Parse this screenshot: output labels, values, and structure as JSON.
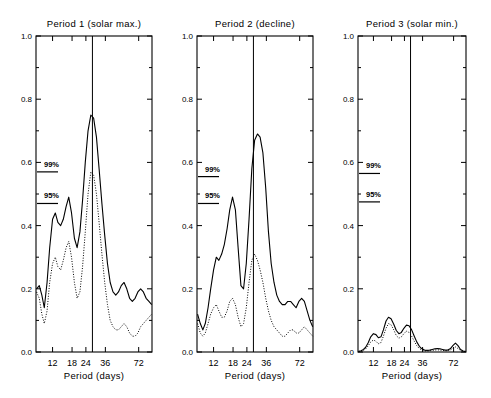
{
  "figure": {
    "xlabel": "Period (days)",
    "x_ticks": [
      "12",
      "18",
      "24",
      "36",
      "72"
    ],
    "y_ticks": [
      "0.0",
      "0.2",
      "0.4",
      "0.6",
      "0.8",
      "1.0"
    ],
    "sig99_label": "99%",
    "sig95_label": "95%"
  },
  "chart_data": [
    {
      "type": "line",
      "title": "Period 1 (solar max.)",
      "xlabel": "Period (days)",
      "ylabel": "",
      "xscale": "log",
      "xlim": [
        8.5,
        95
      ],
      "ylim": [
        0.0,
        1.0
      ],
      "xticks": [
        12,
        18,
        24,
        36,
        72
      ],
      "yticks": [
        0.0,
        0.2,
        0.4,
        0.6,
        0.8,
        1.0
      ],
      "grid": false,
      "legend": "none",
      "annotations": [
        {
          "text": "99%",
          "value": 0.57
        },
        {
          "text": "95%",
          "value": 0.47
        }
      ],
      "vline": 27.5,
      "series": [
        {
          "name": "solid",
          "style": "solid",
          "x": [
            8.6,
            9.1,
            9.6,
            10.1,
            10.7,
            11.3,
            12.0,
            12.7,
            13.4,
            14.2,
            15.0,
            15.9,
            16.8,
            17.8,
            18.9,
            20.0,
            21.2,
            22.4,
            23.7,
            25.1,
            26.6,
            28.2,
            29.9,
            31.6,
            33.5,
            35.5,
            37.6,
            39.8,
            42.2,
            44.7,
            47.3,
            50.1,
            53.1,
            56.2,
            59.6,
            63.1,
            66.8,
            70.8,
            75.0,
            79.4,
            84.1,
            89.1,
            94.4
          ],
          "y": [
            0.2,
            0.21,
            0.18,
            0.14,
            0.22,
            0.33,
            0.42,
            0.44,
            0.41,
            0.4,
            0.42,
            0.46,
            0.49,
            0.44,
            0.36,
            0.33,
            0.38,
            0.48,
            0.6,
            0.7,
            0.75,
            0.74,
            0.68,
            0.58,
            0.47,
            0.37,
            0.28,
            0.22,
            0.19,
            0.18,
            0.19,
            0.21,
            0.22,
            0.2,
            0.17,
            0.16,
            0.17,
            0.19,
            0.2,
            0.19,
            0.17,
            0.16,
            0.15
          ]
        },
        {
          "name": "dotted",
          "style": "dotted",
          "x": [
            8.6,
            9.1,
            9.6,
            10.1,
            10.7,
            11.3,
            12.0,
            12.7,
            13.4,
            14.2,
            15.0,
            15.9,
            16.8,
            17.8,
            18.9,
            20.0,
            21.2,
            22.4,
            23.7,
            25.1,
            26.6,
            28.2,
            29.9,
            31.6,
            33.5,
            35.5,
            37.6,
            39.8,
            42.2,
            44.7,
            47.3,
            50.1,
            53.1,
            56.2,
            59.6,
            63.1,
            66.8,
            70.8,
            75.0,
            79.4,
            84.1,
            89.1,
            94.4
          ],
          "y": [
            0.19,
            0.17,
            0.12,
            0.09,
            0.13,
            0.22,
            0.28,
            0.3,
            0.27,
            0.26,
            0.29,
            0.33,
            0.35,
            0.3,
            0.22,
            0.17,
            0.19,
            0.27,
            0.38,
            0.5,
            0.57,
            0.56,
            0.5,
            0.41,
            0.31,
            0.22,
            0.15,
            0.1,
            0.08,
            0.07,
            0.07,
            0.08,
            0.09,
            0.08,
            0.06,
            0.05,
            0.05,
            0.06,
            0.08,
            0.09,
            0.1,
            0.11,
            0.12
          ]
        }
      ]
    },
    {
      "type": "line",
      "title": "Period 2 (decline)",
      "xlabel": "Period (days)",
      "ylabel": "",
      "xscale": "log",
      "xlim": [
        8.5,
        95
      ],
      "ylim": [
        0.0,
        1.0
      ],
      "xticks": [
        12,
        18,
        24,
        36,
        72
      ],
      "yticks": [
        0.0,
        0.2,
        0.4,
        0.6,
        0.8,
        1.0
      ],
      "grid": false,
      "legend": "none",
      "annotations": [
        {
          "text": "99%",
          "value": 0.555
        },
        {
          "text": "95%",
          "value": 0.47
        }
      ],
      "vline": 27.5,
      "series": [
        {
          "name": "solid",
          "style": "solid",
          "x": [
            8.6,
            9.1,
            9.6,
            10.1,
            10.7,
            11.3,
            12.0,
            12.7,
            13.4,
            14.2,
            15.0,
            15.9,
            16.8,
            17.8,
            18.9,
            20.0,
            21.2,
            22.4,
            23.7,
            25.1,
            26.6,
            28.2,
            29.9,
            31.6,
            33.5,
            35.5,
            37.6,
            39.8,
            42.2,
            44.7,
            47.3,
            50.1,
            53.1,
            56.2,
            59.6,
            63.1,
            66.8,
            70.8,
            75.0,
            79.4,
            84.1,
            89.1,
            94.4
          ],
          "y": [
            0.12,
            0.09,
            0.07,
            0.09,
            0.14,
            0.2,
            0.26,
            0.3,
            0.29,
            0.31,
            0.34,
            0.39,
            0.45,
            0.49,
            0.45,
            0.33,
            0.21,
            0.2,
            0.28,
            0.42,
            0.58,
            0.67,
            0.69,
            0.68,
            0.63,
            0.52,
            0.38,
            0.28,
            0.22,
            0.18,
            0.16,
            0.15,
            0.15,
            0.16,
            0.16,
            0.15,
            0.14,
            0.16,
            0.17,
            0.16,
            0.13,
            0.1,
            0.08
          ]
        },
        {
          "name": "dotted",
          "style": "dotted",
          "x": [
            8.6,
            9.1,
            9.6,
            10.1,
            10.7,
            11.3,
            12.0,
            12.7,
            13.4,
            14.2,
            15.0,
            15.9,
            16.8,
            17.8,
            18.9,
            20.0,
            21.2,
            22.4,
            23.7,
            25.1,
            26.6,
            28.2,
            29.9,
            31.6,
            33.5,
            35.5,
            37.6,
            39.8,
            42.2,
            44.7,
            47.3,
            50.1,
            53.1,
            56.2,
            59.6,
            63.1,
            66.8,
            70.8,
            75.0,
            79.4,
            84.1,
            89.1,
            94.4
          ],
          "y": [
            0.09,
            0.06,
            0.05,
            0.06,
            0.09,
            0.12,
            0.14,
            0.15,
            0.13,
            0.11,
            0.11,
            0.13,
            0.16,
            0.17,
            0.15,
            0.11,
            0.08,
            0.09,
            0.14,
            0.22,
            0.29,
            0.31,
            0.29,
            0.26,
            0.22,
            0.17,
            0.13,
            0.1,
            0.08,
            0.07,
            0.06,
            0.05,
            0.05,
            0.06,
            0.07,
            0.07,
            0.06,
            0.06,
            0.07,
            0.08,
            0.07,
            0.06,
            0.05
          ]
        }
      ]
    },
    {
      "type": "line",
      "title": "Period 3 (solar min.)",
      "xlabel": "Period (days)",
      "ylabel": "",
      "xscale": "log",
      "xlim": [
        8.5,
        95
      ],
      "ylim": [
        0.0,
        1.0
      ],
      "xticks": [
        12,
        18,
        24,
        36,
        72
      ],
      "yticks": [
        0.0,
        0.2,
        0.4,
        0.6,
        0.8,
        1.0
      ],
      "grid": false,
      "legend": "none",
      "annotations": [
        {
          "text": "99%",
          "value": 0.565
        },
        {
          "text": "95%",
          "value": 0.475
        }
      ],
      "vline": 27.5,
      "series": [
        {
          "name": "solid",
          "style": "solid",
          "x": [
            8.6,
            9.1,
            9.6,
            10.1,
            10.7,
            11.3,
            12.0,
            12.7,
            13.4,
            14.2,
            15.0,
            15.9,
            16.8,
            17.8,
            18.9,
            20.0,
            21.2,
            22.4,
            23.7,
            25.1,
            26.6,
            28.2,
            29.9,
            31.6,
            33.5,
            35.5,
            37.6,
            39.8,
            42.2,
            44.7,
            47.3,
            50.1,
            53.1,
            56.2,
            59.6,
            63.1,
            66.8,
            70.8,
            75.0,
            79.4,
            84.1,
            89.1,
            94.4
          ],
          "y": [
            0.002,
            0.004,
            0.008,
            0.015,
            0.03,
            0.048,
            0.058,
            0.055,
            0.045,
            0.048,
            0.07,
            0.098,
            0.11,
            0.105,
            0.088,
            0.068,
            0.058,
            0.062,
            0.075,
            0.085,
            0.083,
            0.07,
            0.05,
            0.032,
            0.018,
            0.01,
            0.006,
            0.005,
            0.006,
            0.008,
            0.01,
            0.011,
            0.01,
            0.008,
            0.006,
            0.006,
            0.01,
            0.02,
            0.028,
            0.02,
            0.008,
            0.003,
            0.002
          ]
        },
        {
          "name": "dotted",
          "style": "dotted",
          "x": [
            8.6,
            9.1,
            9.6,
            10.1,
            10.7,
            11.3,
            12.0,
            12.7,
            13.4,
            14.2,
            15.0,
            15.9,
            16.8,
            17.8,
            18.9,
            20.0,
            21.2,
            22.4,
            23.7,
            25.1,
            26.6,
            28.2,
            29.9,
            31.6,
            33.5,
            35.5,
            37.6,
            39.8,
            42.2,
            44.7,
            47.3,
            50.1,
            53.1,
            56.2,
            59.6,
            63.1,
            66.8,
            70.8,
            75.0,
            79.4,
            84.1,
            89.1,
            94.4
          ],
          "y": [
            0.001,
            0.002,
            0.005,
            0.01,
            0.02,
            0.032,
            0.038,
            0.034,
            0.026,
            0.03,
            0.05,
            0.075,
            0.09,
            0.086,
            0.07,
            0.052,
            0.044,
            0.048,
            0.058,
            0.066,
            0.062,
            0.05,
            0.034,
            0.02,
            0.011,
            0.006,
            0.004,
            0.003,
            0.004,
            0.005,
            0.006,
            0.007,
            0.006,
            0.005,
            0.004,
            0.004,
            0.006,
            0.012,
            0.016,
            0.011,
            0.005,
            0.002,
            0.001
          ]
        }
      ]
    }
  ]
}
